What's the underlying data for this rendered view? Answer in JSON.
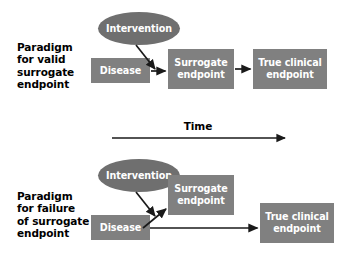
{
  "figure": {
    "background_color": "#ffffff",
    "box_color": "#808080",
    "ellipse_color": "#6f6f6f",
    "arrow_color": "#1a1a1a",
    "text_color": "#ffffff",
    "label_color": "#000000"
  },
  "panels": [
    {
      "id": "valid",
      "label": "Paradigm\nfor valid\nsurrogate\nendpoint",
      "nodes": {
        "intervention": "Intervention",
        "disease": "Disease",
        "surrogate": "Surrogate\nendpoint",
        "true_clinical": "True clinical\nendpoint"
      }
    },
    {
      "id": "failure",
      "label": "Paradigm\nfor failure\nof surrogate\nendpoint",
      "nodes": {
        "intervention": "Intervention",
        "disease": "Disease",
        "surrogate": "Surrogate\nendpoint",
        "true_clinical": "True clinical\nendpoint"
      }
    }
  ],
  "time_axis": {
    "label": "Time"
  }
}
